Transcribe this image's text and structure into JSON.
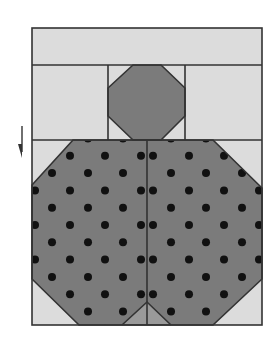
{
  "diagram": {
    "colors": {
      "background": "#ffffff",
      "light_fabric": "#dcdcdc",
      "dark_fabric": "#7b7b7b",
      "seam_light_fill": "#9a9a9a",
      "outline": "#333333",
      "dot": "#111111"
    },
    "pieces": [
      {
        "name": "top-strip",
        "fabric": "light"
      },
      {
        "name": "left-rectangle",
        "fabric": "light"
      },
      {
        "name": "center-square",
        "fabric": "light"
      },
      {
        "name": "small-octagon",
        "fabric": "dark"
      },
      {
        "name": "right-rectangle",
        "fabric": "light"
      },
      {
        "name": "large-block-left-half",
        "fabric": "dark-polka-dot"
      },
      {
        "name": "large-block-right-half",
        "fabric": "dark-polka-dot"
      },
      {
        "name": "corner-triangles",
        "fabric": "light",
        "count": 4
      },
      {
        "name": "bottom-center-wedge",
        "fabric": "dark"
      }
    ],
    "arrow": {
      "direction": "down",
      "meaning": "pressing direction indicator"
    }
  }
}
